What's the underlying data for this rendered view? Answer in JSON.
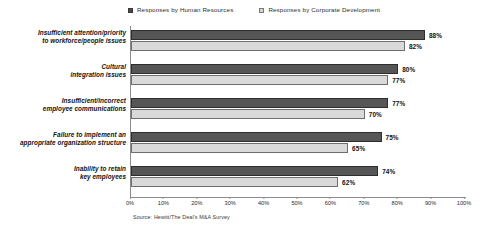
{
  "chart_data": {
    "type": "bar",
    "orientation": "horizontal",
    "title": "",
    "xlabel": "",
    "ylabel": "",
    "xlim": [
      0,
      100
    ],
    "grid": false,
    "legend_position": "top",
    "categories": [
      "Insufficient attention/priority to workforce/people issues",
      "Cultural integration issues",
      "Insufficient/incorrect employee communications",
      "Failure to implement an appropriate organization structure",
      "Inability to retain key employees"
    ],
    "category_lines": [
      [
        "Insufficient attention/priority",
        "to workforce/people issues"
      ],
      [
        "Cultural",
        "integration issues"
      ],
      [
        "Insufficient/incorrect",
        "employee communications"
      ],
      [
        "Failure to implement an",
        "appropriate organization structure"
      ],
      [
        "Inability to retain",
        "key employees"
      ]
    ],
    "series": [
      {
        "name": "Responses by Human Resources",
        "color": "#565656",
        "values": [
          88,
          80,
          77,
          75,
          74
        ],
        "labels": [
          "88%",
          "80%",
          "77%",
          "75%",
          "74%"
        ]
      },
      {
        "name": "Responses by Corporate Development",
        "color": "#d9d9d9",
        "values": [
          82,
          77,
          70,
          65,
          62
        ],
        "labels": [
          "82%",
          "77%",
          "70%",
          "65%",
          "62%"
        ]
      }
    ],
    "x_ticks": [
      0,
      10,
      20,
      30,
      40,
      50,
      60,
      70,
      80,
      90,
      100
    ],
    "x_tick_labels": [
      "0%",
      "10%",
      "20%",
      "30%",
      "40%",
      "50%",
      "60%",
      "70%",
      "80%",
      "90%",
      "100%"
    ]
  },
  "legend": {
    "entries": [
      {
        "label": "Responses by Human Resources",
        "swatch": "series-hr"
      },
      {
        "label": "Responses by Corporate Development",
        "swatch": "series-cd"
      }
    ]
  },
  "footer": {
    "source": "Source: Hewitt/The Deal's M&A Survey"
  }
}
